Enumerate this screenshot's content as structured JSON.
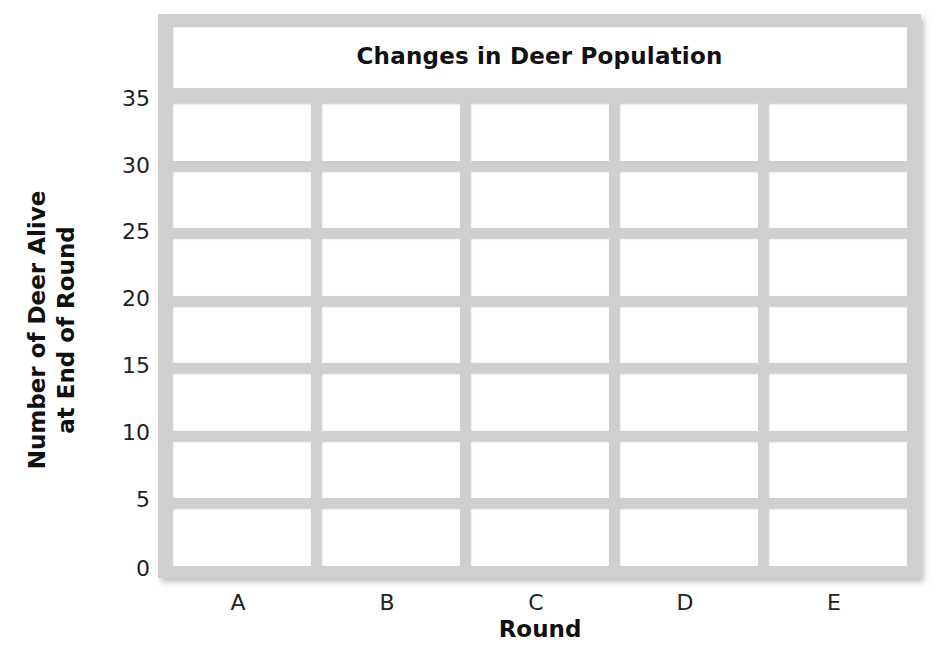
{
  "chart_data": {
    "type": "bar",
    "title": "Changes in Deer Population",
    "xlabel": "Round",
    "ylabel": "Number of Deer Alive at End of Round",
    "ylabel_lines": [
      "Number of Deer Alive",
      "at End of Round"
    ],
    "categories": [
      "A",
      "B",
      "C",
      "D",
      "E"
    ],
    "values": [
      null,
      null,
      null,
      null,
      null
    ],
    "ylim": [
      0,
      35
    ],
    "yticks": [
      "35",
      "30",
      "25",
      "20",
      "15",
      "10",
      "5",
      "0"
    ],
    "grid": true,
    "note": "Blank data-entry grid; no data plotted"
  }
}
